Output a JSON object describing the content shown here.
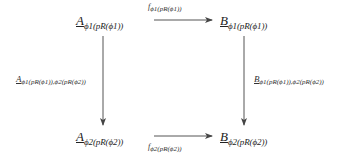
{
  "diagram": {
    "type": "commutative-square",
    "nodes": {
      "top_left": {
        "main": "A",
        "sub": "ϕ1(pR(ϕ1))"
      },
      "top_right": {
        "main": "B",
        "sub": "ϕ1(pR(ϕ1))"
      },
      "bottom_left": {
        "main": "A",
        "sub": "ϕ2(pR(ϕ2))"
      },
      "bottom_right": {
        "main": "B",
        "sub": "ϕ2(pR(ϕ2))"
      }
    },
    "edges": {
      "top": {
        "main": "f",
        "sub": "ϕ1(pR(ϕ1))",
        "from": "top_left",
        "to": "top_right"
      },
      "bottom": {
        "main": "f",
        "sub": "ϕ2(pR(ϕ2))",
        "from": "bottom_left",
        "to": "bottom_right"
      },
      "left": {
        "main": "A",
        "sub": "ϕ1(pR(ϕ1)),ϕ2(pR(ϕ2))",
        "from": "top_left",
        "to": "bottom_left"
      },
      "right": {
        "main": "B",
        "sub": "ϕ1(pR(ϕ1)),ϕ2(pR(ϕ2))",
        "from": "top_right",
        "to": "bottom_right"
      }
    }
  }
}
